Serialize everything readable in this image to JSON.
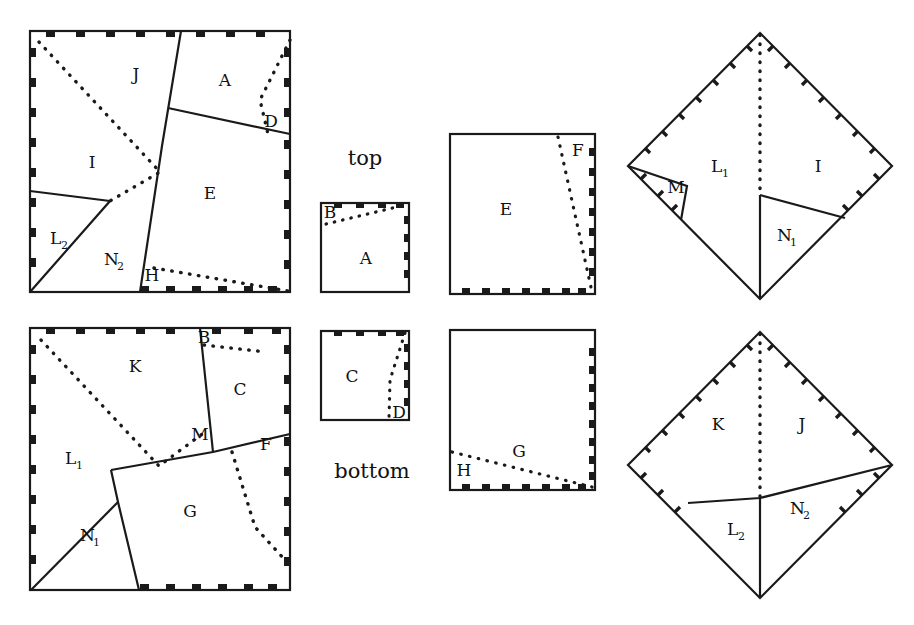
{
  "figure": {
    "title": "",
    "captions": {
      "top": "top",
      "bottom": "bottom"
    },
    "panels": [
      {
        "id": "big-square-top",
        "kind": "square",
        "position": {
          "x": 30,
          "y": 31,
          "w": 260,
          "h": 261
        },
        "labels": [
          {
            "text": "J",
            "sub": "",
            "x": 136,
            "y": 80
          },
          {
            "text": "A",
            "sub": "",
            "x": 225,
            "y": 86
          },
          {
            "text": "D",
            "sub": "",
            "x": 271,
            "y": 127
          },
          {
            "text": "I",
            "sub": "",
            "x": 92,
            "y": 168
          },
          {
            "text": "E",
            "sub": "",
            "x": 210,
            "y": 199
          },
          {
            "text": "L",
            "sub": "2",
            "x": 56,
            "y": 244
          },
          {
            "text": "N",
            "sub": "2",
            "x": 112,
            "y": 265
          },
          {
            "text": "H",
            "sub": "",
            "x": 152,
            "y": 281
          }
        ]
      },
      {
        "id": "big-square-bottom",
        "kind": "square",
        "position": {
          "x": 30,
          "y": 328,
          "w": 260,
          "h": 262
        },
        "labels": [
          {
            "text": "K",
            "sub": "",
            "x": 135,
            "y": 372
          },
          {
            "text": "B",
            "sub": "",
            "x": 204,
            "y": 343
          },
          {
            "text": "C",
            "sub": "",
            "x": 240,
            "y": 395
          },
          {
            "text": "M",
            "sub": "",
            "x": 200,
            "y": 440
          },
          {
            "text": "F",
            "sub": "",
            "x": 266,
            "y": 450
          },
          {
            "text": "L",
            "sub": "1",
            "x": 71,
            "y": 464
          },
          {
            "text": "G",
            "sub": "",
            "x": 190,
            "y": 517
          },
          {
            "text": "N",
            "sub": "1",
            "x": 88,
            "y": 541
          }
        ]
      },
      {
        "id": "small-square-top",
        "kind": "square",
        "position": {
          "x": 321,
          "y": 203,
          "w": 88,
          "h": 89
        },
        "caption": "top",
        "labels": [
          {
            "text": "B",
            "sub": "",
            "x": 330,
            "y": 214
          },
          {
            "text": "A",
            "sub": "",
            "x": 366,
            "y": 262
          }
        ]
      },
      {
        "id": "small-square-bottom",
        "kind": "square",
        "position": {
          "x": 321,
          "y": 331,
          "w": 88,
          "h": 89
        },
        "caption": "bottom",
        "labels": [
          {
            "text": "C",
            "sub": "",
            "x": 352,
            "y": 380
          },
          {
            "text": "D",
            "sub": "",
            "x": 398,
            "y": 414
          }
        ]
      },
      {
        "id": "mid-square-top",
        "kind": "square",
        "position": {
          "x": 450,
          "y": 134,
          "w": 145,
          "h": 160
        },
        "labels": [
          {
            "text": "E",
            "sub": "",
            "x": 506,
            "y": 212
          },
          {
            "text": "F",
            "sub": "",
            "x": 578,
            "y": 153
          }
        ]
      },
      {
        "id": "mid-square-bottom",
        "kind": "square",
        "position": {
          "x": 450,
          "y": 330,
          "w": 145,
          "h": 160
        },
        "labels": [
          {
            "text": "G",
            "sub": "",
            "x": 519,
            "y": 453
          },
          {
            "text": "H",
            "sub": "",
            "x": 464,
            "y": 472
          }
        ]
      },
      {
        "id": "diamond-top",
        "kind": "diamond",
        "position": {
          "cx": 760,
          "cy": 166,
          "rx": 132,
          "ry": 133
        },
        "labels": [
          {
            "text": "L",
            "sub": "1",
            "x": 717,
            "y": 167
          },
          {
            "text": "I",
            "sub": "",
            "x": 818,
            "y": 164
          },
          {
            "text": "M",
            "sub": "",
            "x": 676,
            "y": 187
          },
          {
            "text": "N",
            "sub": "1",
            "x": 785,
            "y": 232
          }
        ]
      },
      {
        "id": "diamond-bottom",
        "kind": "diamond",
        "position": {
          "cx": 760,
          "cy": 465,
          "rx": 132,
          "ry": 133
        },
        "labels": [
          {
            "text": "K",
            "sub": "",
            "x": 718,
            "y": 424
          },
          {
            "text": "J",
            "sub": "",
            "x": 802,
            "y": 424
          },
          {
            "text": "L",
            "sub": "2",
            "x": 735,
            "y": 529
          },
          {
            "text": "N",
            "sub": "2",
            "x": 799,
            "y": 508
          }
        ]
      }
    ],
    "region_letters": [
      "A",
      "B",
      "C",
      "D",
      "E",
      "F",
      "G",
      "H",
      "I",
      "J",
      "K",
      "L1",
      "L2",
      "M",
      "N1",
      "N2"
    ],
    "colors": {
      "stroke": "#1a1a1a",
      "fill": "#ffffff",
      "background": "#ffffff"
    },
    "line_styles": {
      "solid": "cut-edge",
      "dotted": "fold-or-hidden-edge",
      "ticks": "hatch-marks"
    }
  }
}
